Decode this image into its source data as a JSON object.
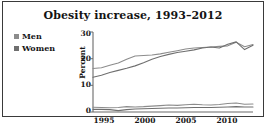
{
  "figure": {
    "title": "Obesity increase, 1993–2012",
    "caption_partial": "",
    "border_color": "#3a3a3a",
    "background": "#ffffff"
  },
  "legend": {
    "position": "left",
    "entries": [
      {
        "label": "Men",
        "swatch_color": "#8c8c8c",
        "marker": "square"
      },
      {
        "label": "Women",
        "swatch_color": "#6f6f6f",
        "marker": "square"
      }
    ]
  },
  "axes": {
    "y_label": "Percent",
    "y_ticks": [
      "0",
      "10",
      "20",
      "30"
    ],
    "x_ticks": [
      "1995",
      "2000",
      "2005",
      "2010"
    ],
    "axis_color": "#6a6a6a"
  },
  "chart_data": {
    "type": "line",
    "title": "Obesity increase, 1993–2012",
    "xlabel": "",
    "ylabel": "Percent",
    "xlim": [
      1993,
      2012
    ],
    "ylim": [
      0,
      30
    ],
    "yticks": [
      0,
      10,
      20,
      30
    ],
    "xticks": [
      1995,
      2000,
      2005,
      2010
    ],
    "grid": false,
    "legend_position": "upper left (outside plot)",
    "x": [
      1993,
      1994,
      1995,
      1996,
      1997,
      1998,
      1999,
      2000,
      2001,
      2002,
      2003,
      2004,
      2005,
      2006,
      2007,
      2008,
      2009,
      2010,
      2011,
      2012
    ],
    "series": [
      {
        "name": "Men",
        "color": "#8c8c8c",
        "values": [
          16.3,
          16.6,
          17.5,
          18.4,
          19.8,
          21.0,
          21.2,
          21.4,
          21.8,
          22.4,
          23.0,
          23.6,
          24.0,
          24.2,
          24.4,
          24.6,
          24.8,
          26.2,
          24.5,
          25.3
        ]
      },
      {
        "name": "Women",
        "color": "#6f6f6f",
        "values": [
          13.0,
          13.8,
          14.8,
          15.6,
          16.4,
          17.3,
          18.5,
          19.8,
          20.8,
          21.6,
          22.3,
          22.8,
          23.3,
          24.0,
          24.4,
          24.0,
          25.4,
          26.3,
          23.4,
          25.0
        ]
      },
      {
        "name": "Men (secondary, lower band)",
        "color": "#8c8c8c",
        "values": [
          1.8,
          1.7,
          1.6,
          1.7,
          2.0,
          1.9,
          2.0,
          2.2,
          2.4,
          2.6,
          2.5,
          2.7,
          2.9,
          2.7,
          2.6,
          2.8,
          3.2,
          3.4,
          2.9,
          3.0
        ]
      },
      {
        "name": "Women (secondary, lower band)",
        "color": "#6f6f6f",
        "values": [
          1.0,
          1.0,
          0.9,
          0.5,
          0.9,
          1.1,
          1.2,
          1.3,
          1.4,
          1.5,
          1.5,
          1.6,
          1.7,
          1.7,
          1.7,
          1.8,
          1.9,
          2.0,
          1.9,
          1.9
        ]
      }
    ]
  }
}
